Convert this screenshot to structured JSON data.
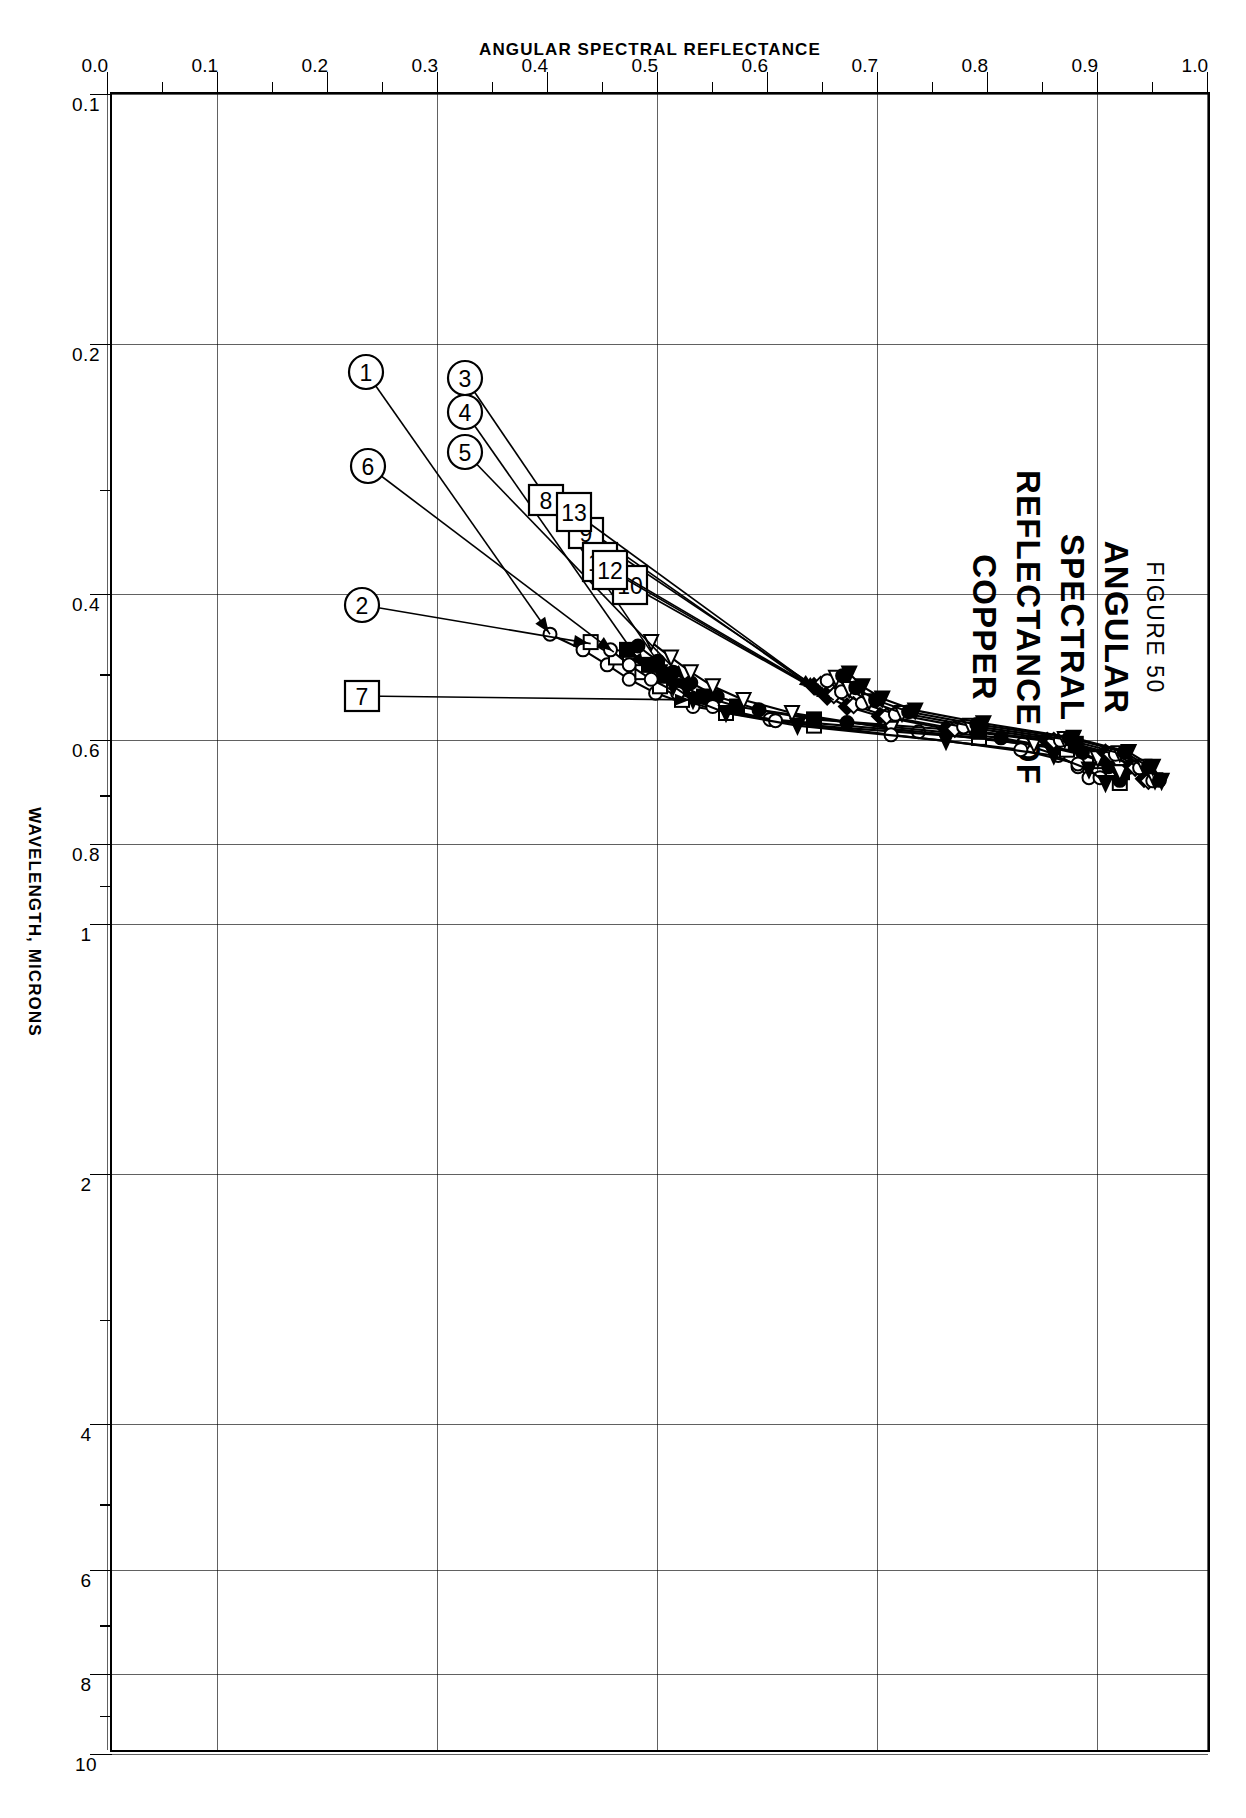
{
  "figure": {
    "number_label": "FIGURE 50",
    "title_lines": [
      "ANGULAR",
      "SPECTRAL",
      "REFLECTANCE  OF",
      "COPPER"
    ]
  },
  "axes": {
    "x_title": "WAVELENGTH, MICRONS",
    "y_title": "ANGULAR  SPECTRAL  REFLECTANCE",
    "x_tick_labels": [
      "0.1",
      "0.2",
      "0.4",
      "0.6",
      "0.8",
      "1",
      "2",
      "4",
      "6",
      "8",
      "10"
    ],
    "y_tick_labels": [
      "0.0",
      "0.1",
      "0.2",
      "0.3",
      "0.4",
      "0.5",
      "0.6",
      "0.7",
      "0.8",
      "0.9",
      "1.0"
    ]
  },
  "callouts": {
    "circled": [
      "1",
      "2",
      "3",
      "4",
      "5",
      "6",
      "7"
    ],
    "boxed": [
      "8",
      "9",
      "10",
      "11",
      "12",
      "13"
    ]
  },
  "chart_data": {
    "type": "line",
    "title": "ANGULAR SPECTRAL REFLECTANCE OF COPPER",
    "xlabel": "WAVELENGTH, MICRONS",
    "ylabel": "ANGULAR SPECTRAL REFLECTANCE",
    "xscale": "log",
    "xlim": [
      0.1,
      10
    ],
    "ylim": [
      0.0,
      1.0
    ],
    "grid": true,
    "legend": "none (numbered callouts 1-13 on curves)",
    "x_ticks": [
      0.1,
      0.2,
      0.4,
      0.6,
      0.8,
      1,
      2,
      4,
      6,
      8,
      10
    ],
    "y_ticks": [
      0.0,
      0.1,
      0.2,
      0.3,
      0.4,
      0.5,
      0.6,
      0.7,
      0.8,
      0.9,
      1.0
    ],
    "series": [
      {
        "name": "1",
        "marker": "open-circle",
        "x": [
          0.45,
          0.47,
          0.49,
          0.51,
          0.53,
          0.55,
          0.57,
          0.59,
          0.61,
          0.63,
          0.65,
          0.67
        ],
        "y": [
          0.4,
          0.43,
          0.452,
          0.472,
          0.496,
          0.53,
          0.6,
          0.735,
          0.83,
          0.862,
          0.88,
          0.89
        ]
      },
      {
        "name": "2",
        "marker": "open-square",
        "x": [
          0.46,
          0.48,
          0.5,
          0.52,
          0.54,
          0.56,
          0.58,
          0.6,
          0.62,
          0.64,
          0.66,
          0.68
        ],
        "y": [
          0.437,
          0.46,
          0.484,
          0.5,
          0.52,
          0.56,
          0.64,
          0.79,
          0.87,
          0.9,
          0.912,
          0.918
        ]
      },
      {
        "name": "3",
        "marker": "filled-square",
        "x": [
          0.47,
          0.49,
          0.505,
          0.52,
          0.535,
          0.55,
          0.57,
          0.59,
          0.61,
          0.635,
          0.66
        ],
        "y": [
          0.47,
          0.49,
          0.505,
          0.52,
          0.54,
          0.57,
          0.64,
          0.79,
          0.878,
          0.905,
          0.92
        ]
      },
      {
        "name": "4",
        "marker": "filled-circle",
        "x": [
          0.465,
          0.485,
          0.5,
          0.515,
          0.535,
          0.555,
          0.575,
          0.6,
          0.625,
          0.65,
          0.675
        ],
        "y": [
          0.48,
          0.498,
          0.512,
          0.528,
          0.552,
          0.59,
          0.67,
          0.81,
          0.884,
          0.908,
          0.918
        ]
      },
      {
        "name": "5",
        "marker": "open-triangle",
        "x": [
          0.46,
          0.48,
          0.5,
          0.52,
          0.54,
          0.56,
          0.585,
          0.61,
          0.635,
          0.66
        ],
        "y": [
          0.492,
          0.51,
          0.528,
          0.548,
          0.576,
          0.62,
          0.71,
          0.84,
          0.898,
          0.918
        ]
      },
      {
        "name": "6",
        "marker": "open-circle",
        "x": [
          0.47,
          0.49,
          0.51,
          0.53,
          0.55,
          0.572,
          0.595,
          0.62,
          0.645,
          0.67
        ],
        "y": [
          0.455,
          0.472,
          0.492,
          0.516,
          0.548,
          0.605,
          0.71,
          0.828,
          0.88,
          0.9
        ]
      },
      {
        "name": "7",
        "marker": "filled-triangle",
        "x": [
          0.5,
          0.52,
          0.54,
          0.56,
          0.58,
          0.605,
          0.63,
          0.655,
          0.68
        ],
        "y": [
          0.5,
          0.512,
          0.53,
          0.56,
          0.625,
          0.76,
          0.858,
          0.89,
          0.905
        ]
      },
      {
        "name": "8",
        "marker": "filled-diamond",
        "x": [
          0.52,
          0.535,
          0.55,
          0.565,
          0.585,
          0.605,
          0.625,
          0.648,
          0.672
        ],
        "y": [
          0.64,
          0.652,
          0.67,
          0.7,
          0.76,
          0.852,
          0.905,
          0.928,
          0.94
        ]
      },
      {
        "name": "9",
        "marker": "open-diamond",
        "x": [
          0.518,
          0.533,
          0.548,
          0.565,
          0.585,
          0.605,
          0.628,
          0.652,
          0.676
        ],
        "y": [
          0.646,
          0.658,
          0.676,
          0.706,
          0.768,
          0.858,
          0.91,
          0.932,
          0.944
        ]
      },
      {
        "name": "10",
        "marker": "open-circle",
        "x": [
          0.512,
          0.528,
          0.545,
          0.562,
          0.582,
          0.604,
          0.628,
          0.652,
          0.676
        ],
        "y": [
          0.652,
          0.665,
          0.684,
          0.714,
          0.776,
          0.864,
          0.914,
          0.936,
          0.948
        ]
      },
      {
        "name": "11",
        "marker": "open-triangle",
        "x": [
          0.508,
          0.524,
          0.542,
          0.56,
          0.58,
          0.602,
          0.626,
          0.65,
          0.675
        ],
        "y": [
          0.66,
          0.672,
          0.69,
          0.72,
          0.782,
          0.868,
          0.918,
          0.94,
          0.95
        ]
      },
      {
        "name": "12",
        "marker": "filled-circle",
        "x": [
          0.505,
          0.522,
          0.54,
          0.558,
          0.578,
          0.6,
          0.624,
          0.65,
          0.675
        ],
        "y": [
          0.666,
          0.678,
          0.696,
          0.726,
          0.788,
          0.872,
          0.922,
          0.944,
          0.954
        ]
      },
      {
        "name": "13",
        "marker": "filled-triangle",
        "x": [
          0.502,
          0.52,
          0.538,
          0.556,
          0.576,
          0.6,
          0.624,
          0.65,
          0.676
        ],
        "y": [
          0.672,
          0.684,
          0.702,
          0.732,
          0.794,
          0.876,
          0.926,
          0.948,
          0.956
        ]
      }
    ]
  }
}
